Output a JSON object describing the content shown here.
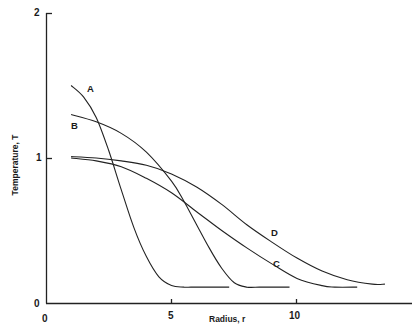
{
  "chart_data": {
    "type": "line",
    "title": "",
    "xlabel": "Radius, r",
    "ylabel": "Temperature, T",
    "xlim": [
      0,
      14
    ],
    "ylim": [
      0,
      2
    ],
    "x_ticks": [
      0,
      5,
      10
    ],
    "y_ticks": [
      0,
      1,
      2
    ],
    "grid": false,
    "legend": "inline labels on curves",
    "series": [
      {
        "name": "A",
        "x": [
          1.0,
          1.5,
          2.0,
          2.5,
          3.0,
          3.5,
          4.0,
          4.5,
          5.0,
          5.5,
          6.0,
          7.0,
          7.3
        ],
        "y": [
          1.5,
          1.42,
          1.28,
          1.05,
          0.78,
          0.52,
          0.32,
          0.18,
          0.12,
          0.11,
          0.11,
          0.11,
          0.11
        ]
      },
      {
        "name": "B",
        "x": [
          1.0,
          2.0,
          3.0,
          4.0,
          5.0,
          5.5,
          6.0,
          6.5,
          7.0,
          7.5,
          8.0,
          8.5,
          9.0,
          9.7
        ],
        "y": [
          1.3,
          1.25,
          1.17,
          1.04,
          0.84,
          0.7,
          0.54,
          0.38,
          0.24,
          0.14,
          0.11,
          0.11,
          0.11,
          0.11
        ]
      },
      {
        "name": "C",
        "x": [
          1.0,
          2.0,
          3.0,
          4.0,
          5.0,
          6.0,
          7.0,
          8.0,
          9.0,
          10.0,
          11.0,
          11.5,
          12.4
        ],
        "y": [
          1.0,
          0.98,
          0.94,
          0.86,
          0.76,
          0.63,
          0.5,
          0.38,
          0.27,
          0.17,
          0.12,
          0.11,
          0.11
        ]
      },
      {
        "name": "D",
        "x": [
          1.0,
          2.0,
          3.0,
          4.0,
          5.0,
          6.0,
          7.0,
          8.0,
          9.0,
          10.0,
          11.0,
          12.0,
          13.0,
          13.5
        ],
        "y": [
          1.01,
          1.0,
          0.98,
          0.95,
          0.89,
          0.8,
          0.68,
          0.54,
          0.42,
          0.31,
          0.22,
          0.16,
          0.13,
          0.13
        ]
      }
    ],
    "annotations": [
      {
        "text": "A",
        "x": 1.8,
        "y": 1.48
      },
      {
        "text": "B",
        "x": 1.1,
        "y": 1.22
      },
      {
        "text": "C",
        "x": 9.9,
        "y": 0.3
      },
      {
        "text": "D",
        "x": 9.2,
        "y": 0.48
      }
    ]
  },
  "labels": {
    "y2": "2",
    "y1": "1",
    "y0": "0",
    "x0": "0",
    "x5": "5",
    "x10": "10",
    "xlabel": "Radius, r",
    "ylabel": "Temperature, T",
    "A": "A",
    "B": "B",
    "C": "C",
    "D": "D"
  }
}
